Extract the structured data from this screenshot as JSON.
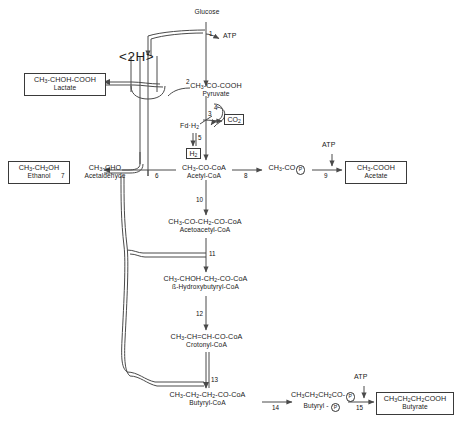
{
  "diagram": {
    "hydrogen_carrier_label": "<2H>",
    "nodes": {
      "glucose": {
        "formula": "",
        "name": "Glucose"
      },
      "pyruvate": {
        "formula": "CH3-CO-COOH",
        "name": "Pyruvate"
      },
      "lactate": {
        "formula": "CH3-CHOH-COOH",
        "name": "Lactate"
      },
      "acetaldehyde": {
        "formula": "CH3-CHO",
        "name": "Acetaldehyde"
      },
      "ethanol": {
        "formula": "CH3-CH2OH",
        "name": "Ethanol"
      },
      "acetyl_coa": {
        "formula": "CH3-CO-CoA",
        "name": "Acetyl-CoA"
      },
      "acetyl_p": {
        "formula": "CH3-CO-",
        "name": ""
      },
      "acetate": {
        "formula": "CH3-COOH",
        "name": "Acetate"
      },
      "acetoacetyl": {
        "formula": "CH3-CO-CH2-CO-CoA",
        "name": "Acetoacetyl-CoA"
      },
      "hydroxybut": {
        "formula": "CH3-CHOH-CH2-CO-CoA",
        "name": "ß-Hydroxybutyryl-CoA"
      },
      "crotonyl": {
        "formula": "CH3-CH=CH-CO-CoA",
        "name": "Crotonyl-CoA"
      },
      "butyryl_coa": {
        "formula": "CH3-CH2-CH2-CO-CoA",
        "name": "Butyryl-CoA"
      },
      "butyryl_p": {
        "formula": "CH3-CH2-CH2-CO-",
        "name": "Butyryl -"
      },
      "butyrate": {
        "formula": "CH3-CH2-CH2-COOH",
        "name": "Butyrate"
      }
    },
    "cofactors": {
      "atp_glycolysis": "ATP",
      "atp_acetate": "ATP",
      "atp_butyrate": "ATP",
      "ferredoxin": "Fd-H2",
      "hydrogen": "H2",
      "carbon_dioxide": "CO2"
    },
    "steps": [
      {
        "id": "1",
        "label": "1"
      },
      {
        "id": "2",
        "label": "2"
      },
      {
        "id": "3",
        "label": "3"
      },
      {
        "id": "4",
        "label": "4"
      },
      {
        "id": "5",
        "label": "5"
      },
      {
        "id": "6",
        "label": "6"
      },
      {
        "id": "7",
        "label": "7"
      },
      {
        "id": "8",
        "label": "8"
      },
      {
        "id": "9",
        "label": "9"
      },
      {
        "id": "10",
        "label": "10"
      },
      {
        "id": "11",
        "label": "11"
      },
      {
        "id": "12",
        "label": "12"
      },
      {
        "id": "13",
        "label": "13"
      },
      {
        "id": "14",
        "label": "14"
      },
      {
        "id": "15",
        "label": "15"
      }
    ],
    "colors": {
      "line": "#4a4a4a",
      "text": "#1a1a1a",
      "background": "#ffffff"
    }
  }
}
